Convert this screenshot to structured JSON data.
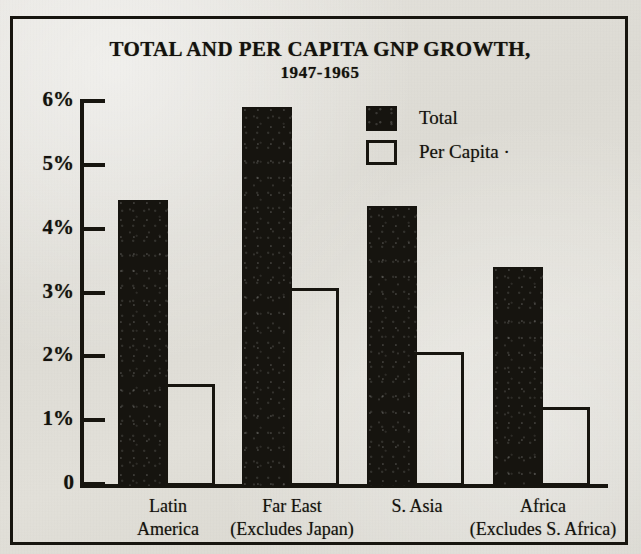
{
  "chart_data": {
    "type": "bar",
    "title": "TOTAL AND PER CAPITA GNP GROWTH,",
    "subtitle": "1947-1965",
    "xlabel": "",
    "ylabel": "",
    "ylim": [
      0,
      6
    ],
    "grid": false,
    "legend_position": "upper-right-inside",
    "ytick_labels": [
      "6%",
      "5%",
      "4%",
      "3%",
      "2%",
      "1%",
      "0"
    ],
    "ytick_values": [
      6,
      5,
      4,
      3,
      2,
      1,
      0
    ],
    "categories": [
      "Latin\nAmerica",
      "Far East\n(Excludes Japan)",
      "S. Asia",
      "Africa\n(Excludes S. Africa)"
    ],
    "category_lines": [
      [
        "Latin",
        "America"
      ],
      [
        "Far East",
        "(Excludes Japan)"
      ],
      [
        "S. Asia",
        ""
      ],
      [
        "Africa",
        "(Excludes S. Africa)"
      ]
    ],
    "series": [
      {
        "name": "Total",
        "style": "filled",
        "color": "#16140f",
        "values": [
          4.45,
          5.9,
          4.35,
          3.4
        ]
      },
      {
        "name": "Per Capita",
        "style": "hollow",
        "color": "#ffffff",
        "values": [
          1.57,
          3.07,
          2.07,
          1.2
        ]
      }
    ]
  },
  "legend": {
    "items": [
      {
        "label": "Total",
        "style": "filled"
      },
      {
        "label": "Per Capita ·",
        "style": "hollow"
      }
    ]
  },
  "colors": {
    "ink": "#17150f",
    "paper": "#e1dfd8"
  }
}
